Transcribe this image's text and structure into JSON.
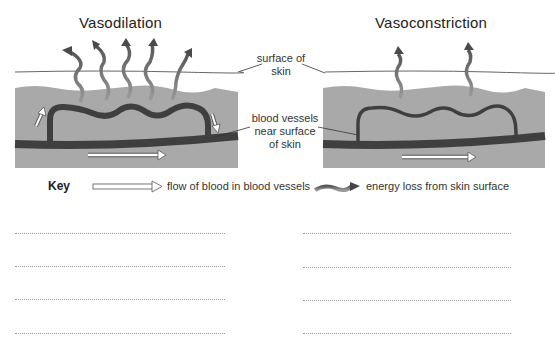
{
  "panels": [
    {
      "title": "Vasodilation",
      "energy_arrows": 5
    },
    {
      "title": "Vasoconstriction",
      "energy_arrows": 2
    }
  ],
  "labels": {
    "surface_of_skin": [
      "surface of",
      "skin"
    ],
    "blood_vessels": [
      "blood vessels",
      "near surface",
      "of skin"
    ]
  },
  "key": {
    "title": "Key",
    "flow_label": "flow of blood in blood vessels",
    "energy_label": "energy loss from skin surface"
  },
  "answer_lines": {
    "left_count": 4,
    "right_count": 4
  },
  "colors": {
    "skin": "#a9a9a9",
    "vessel": "#3f3f3f",
    "energy_arrow": "#7a7a7a",
    "flow_arrow_fill": "#ffffff"
  }
}
